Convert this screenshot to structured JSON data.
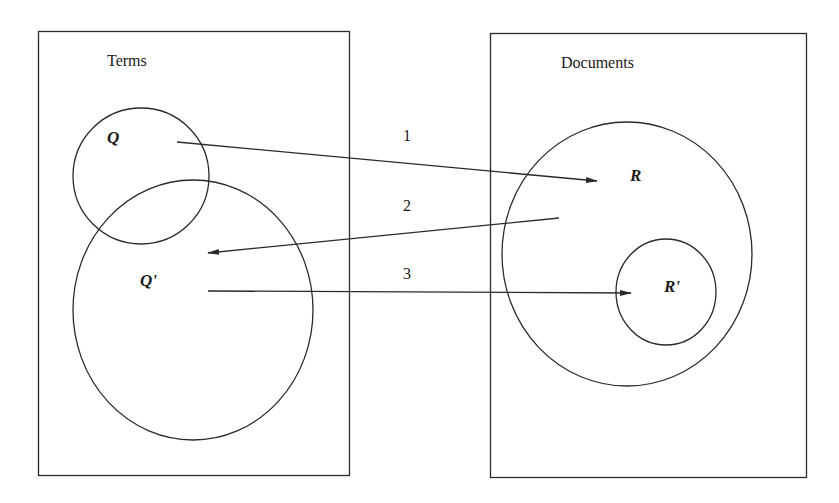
{
  "diagram": {
    "type": "set-mapping diagram (query reformulation / relevance feedback)",
    "stroke_color": "#2a2a2a",
    "background": "#ffffff",
    "panels": [
      {
        "id": "terms",
        "title": "Terms"
      },
      {
        "id": "documents",
        "title": "Documents"
      }
    ],
    "sets": {
      "q": "Q",
      "q_prime": "Q'",
      "r": "R",
      "r_prime": "R'"
    },
    "arrows": [
      {
        "label": "1",
        "from": "Q",
        "to": "R"
      },
      {
        "label": "2",
        "from": "R",
        "to": "Q'"
      },
      {
        "label": "3",
        "from": "Q'",
        "to": "R'"
      }
    ]
  }
}
